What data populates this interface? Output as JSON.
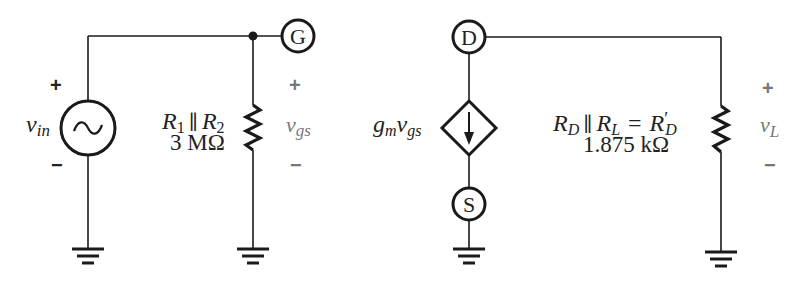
{
  "diagram": {
    "type": "ac-equivalent-circuit",
    "colors": {
      "line": "#1a1a1a",
      "text": "#222222",
      "polarity_gray": "#777777"
    },
    "input_side": {
      "source": {
        "label_main": "v",
        "label_sub": "in",
        "symbol": "~",
        "plus": "+",
        "minus": "−"
      },
      "gate_terminal": {
        "label": "G"
      },
      "resistor": {
        "label_r1": "R",
        "label_r1_sub": "1",
        "parallel": "∥",
        "label_r2": "R",
        "label_r2_sub": "2",
        "value": "3 MΩ"
      },
      "vgs": {
        "label_main": "v",
        "label_sub": "gs",
        "plus": "+",
        "minus": "−"
      }
    },
    "output_side": {
      "drain_terminal": {
        "label": "D"
      },
      "source_terminal": {
        "label": "S"
      },
      "dependent_source": {
        "label_g": "g",
        "label_g_sub": "m",
        "label_v": "v",
        "label_v_sub": "gs"
      },
      "resistor": {
        "rd": "R",
        "rd_sub": "D",
        "parallel": "∥",
        "rl": "R",
        "rl_sub": "L",
        "equals": "=",
        "rdp": "R",
        "rdp_prime": "′",
        "rdp_sub": "D",
        "value": "1.875 kΩ"
      },
      "vl": {
        "label_main": "v",
        "label_sub": "L",
        "plus": "+",
        "minus": "−"
      }
    }
  }
}
